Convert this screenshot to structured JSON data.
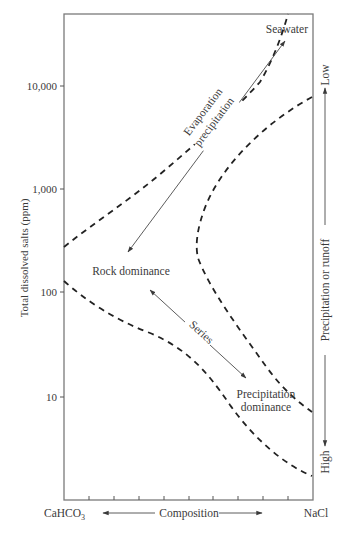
{
  "figure": {
    "y_axis": {
      "title": "Total dissolved salts (ppm)",
      "scale": "log",
      "ticks": [
        {
          "label": "10,000",
          "value": 10000
        },
        {
          "label": "1,000",
          "value": 1000
        },
        {
          "label": "100",
          "value": 100
        },
        {
          "label": "10",
          "value": 10
        }
      ]
    },
    "x_axis": {
      "left_label": "CaHCO",
      "left_label_subscript": "3",
      "center_label": "Composition",
      "right_label": "NaCl",
      "minor_tick_count": 9
    },
    "right_axis": {
      "top_label": "Low",
      "center_label": "Precipitation or runoff",
      "bottom_label": "High"
    },
    "annotations": {
      "seawater": "Seawater",
      "evaporation_line1": "Evaporation",
      "evaporation_line2": "precipitation",
      "rock_dominance": "Rock dominance",
      "series": "Series",
      "precipitation_dominance_line1": "Precipitation",
      "precipitation_dominance_line2": "dominance"
    },
    "colors": {
      "frame": "#7a7a7a",
      "boundary_dashes": "#222222",
      "arrows": "#4a4a4a",
      "text": "#3a3a3a"
    }
  }
}
